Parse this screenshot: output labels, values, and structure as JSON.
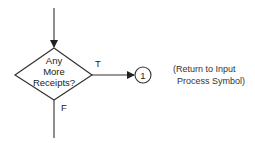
{
  "diagram": {
    "type": "flowchart-fragment",
    "decision": {
      "shape": "diamond",
      "lines": [
        "Any",
        "More",
        "Receipts?"
      ]
    },
    "branches": {
      "true_label": "T",
      "false_label": "F"
    },
    "connector": {
      "shape": "circle",
      "label": "1"
    },
    "note": {
      "line1": "(Return to Input",
      "line2": "Process Symbol)"
    },
    "colors": {
      "stroke": "#333333",
      "background": "#ffffff"
    }
  }
}
